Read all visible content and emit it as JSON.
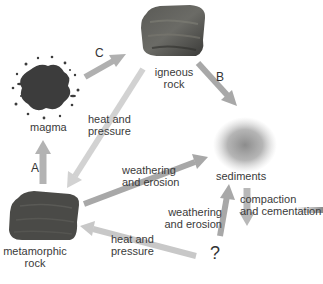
{
  "diagram": {
    "nodes": {
      "magma": {
        "label": "magma"
      },
      "igneous": {
        "label_line1": "igneous",
        "label_line2": "rock"
      },
      "sediments": {
        "label": "sediments"
      },
      "metamorphic": {
        "label_line1": "metamorphic",
        "label_line2": "rock"
      },
      "unknown": {
        "label": "?"
      }
    },
    "arrows": {
      "magma_to_igneous": {
        "letter": "C"
      },
      "igneous_to_sediments": {
        "letter": "B"
      },
      "metamorphic_to_magma": {
        "letter": "A"
      },
      "igneous_to_metamorphic": {
        "line1": "heat and",
        "line2": "pressure"
      },
      "metamorphic_to_sediments": {
        "line1": "weathering",
        "line2": "and erosion"
      },
      "unknown_to_sediments": {
        "line1": "weathering",
        "line2": "and erosion"
      },
      "unknown_to_metamorphic": {
        "line1": "heat and",
        "line2": "pressure"
      },
      "sediments_to_unknown": {
        "line1": "compaction",
        "line2": "and cementation"
      }
    },
    "colors": {
      "arrow_dark": "#a8a8a8",
      "arrow_light": "#cfcfcf",
      "rock": "#4a4a48",
      "magma": "#3c3c3c",
      "sediment": "#9a9a9a"
    }
  }
}
